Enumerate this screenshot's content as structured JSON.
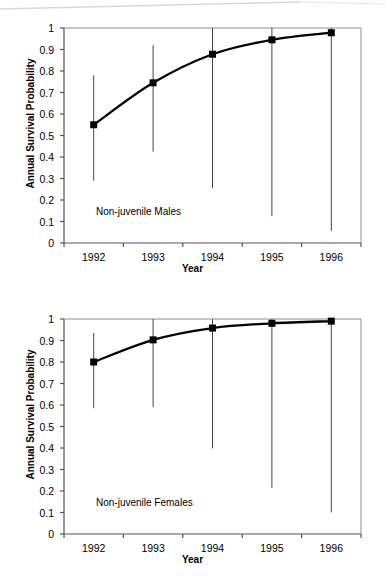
{
  "figure": {
    "background": "#ffffff",
    "line_color": "#000000",
    "marker_color": "#000000",
    "error_bar_color": "#444444",
    "axis_color": "#555555"
  },
  "panels": [
    {
      "id": "non-juvenile-males",
      "annotation": "Non-juvenile Males",
      "chart_data": {
        "type": "line",
        "title": "",
        "subtitle": "",
        "annotation": "Non-juvenile Males",
        "xlabel": "Year",
        "ylabel": "Annual Survival Probability",
        "categories": [
          "1992",
          "1993",
          "1994",
          "1995",
          "1996"
        ],
        "x": [
          1992,
          1993,
          1994,
          1995,
          1996
        ],
        "values": [
          0.55,
          0.745,
          0.878,
          0.945,
          0.978
        ],
        "error_lower": [
          0.29,
          0.425,
          0.255,
          0.125,
          0.055
        ],
        "error_upper": [
          0.78,
          0.92,
          1.0,
          1.0,
          1.0
        ],
        "ylim": [
          0,
          1
        ],
        "yticks": [
          0,
          0.1,
          0.2,
          0.3,
          0.4,
          0.5,
          0.6,
          0.7,
          0.8,
          0.9,
          1
        ],
        "ytick_labels": [
          "0",
          "0.1",
          "0.2",
          "0.3",
          "0.4",
          "0.5",
          "0.6",
          "0.7",
          "0.8",
          "0.9",
          "1"
        ],
        "xtick_labels": [
          "1992",
          "1993",
          "1994",
          "1995",
          "1996"
        ],
        "grid": false,
        "legend": "none",
        "markers": "filled-square",
        "error_bars": "vertical-plain"
      }
    },
    {
      "id": "non-juvenile-females",
      "annotation": "Non-juvenile Females",
      "chart_data": {
        "type": "line",
        "title": "",
        "subtitle": "",
        "annotation": "Non-juvenile Females",
        "xlabel": "Year",
        "ylabel": "Annual Survival Probability",
        "categories": [
          "1992",
          "1993",
          "1994",
          "1995",
          "1996"
        ],
        "x": [
          1992,
          1993,
          1994,
          1995,
          1996
        ],
        "values": [
          0.8,
          0.903,
          0.958,
          0.98,
          0.99
        ],
        "error_lower": [
          0.585,
          0.59,
          0.398,
          0.215,
          0.1
        ],
        "error_upper": [
          0.935,
          1.0,
          1.0,
          1.0,
          1.0
        ],
        "ylim": [
          0,
          1
        ],
        "yticks": [
          0,
          0.1,
          0.2,
          0.3,
          0.4,
          0.5,
          0.6,
          0.7,
          0.8,
          0.9,
          1
        ],
        "ytick_labels": [
          "0",
          "0.1",
          "0.2",
          "0.3",
          "0.4",
          "0.5",
          "0.6",
          "0.7",
          "0.8",
          "0.9",
          "1"
        ],
        "xtick_labels": [
          "1992",
          "1993",
          "1994",
          "1995",
          "1996"
        ],
        "grid": false,
        "legend": "none",
        "markers": "filled-square",
        "error_bars": "vertical-plain"
      }
    }
  ]
}
